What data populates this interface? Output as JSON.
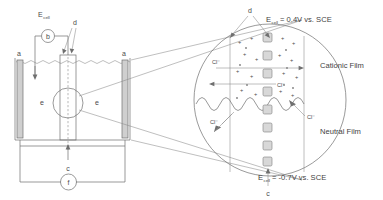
{
  "figure": {
    "title_left": "Electrochemical cell schematic",
    "title_right": "Magnified passive film detail"
  },
  "left_cell": {
    "ecell_label": "E",
    "ecell_sub": "cell",
    "voltmeter_label": "b",
    "pointer_label": "d",
    "electrode_label_left": "a",
    "electrode_label_right": "a",
    "solution_label_left": "e",
    "solution_label_right": "e",
    "current_arrow_label": "c",
    "ammeter_label": "f"
  },
  "detail": {
    "top_pointer_label": "d",
    "bottom_pointer_label": "c",
    "ecell_top_prefix": "E",
    "ecell_top_sub": "cell",
    "ecell_top_value": "= 0.4V vs. SCE",
    "ecell_bottom_prefix": "E",
    "ecell_bottom_sub": "cell",
    "ecell_bottom_value": "= -0.7V vs. SCE",
    "film_upper": "Cationic Film",
    "film_lower": "Neutral Film",
    "ion_labels": [
      "Cl⁻",
      "Cl⁻",
      "Cl⁻",
      "Cl⁻"
    ],
    "charge_symbol": "+"
  },
  "colors": {
    "line": "#6f6f6f",
    "line_light": "#8a8a8a",
    "electrode_fill": "#cfcfcf",
    "square_fill": "#d8d8d8",
    "text": "#4a4a4a",
    "background": "#ffffff"
  }
}
